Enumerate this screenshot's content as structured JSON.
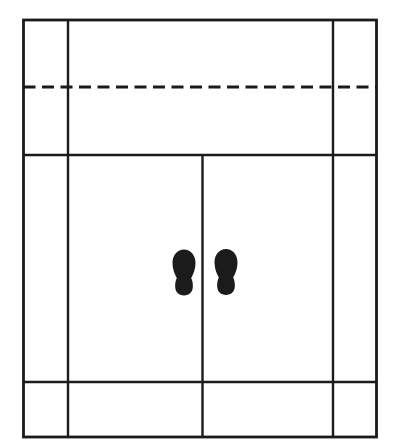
{
  "canvas": {
    "width": 395,
    "height": 447,
    "background_color": "#ffffff",
    "line_color": "#1b1b1b"
  },
  "diagram": {
    "footprint_path": "M 0 -23 C 6.5 -23 11.5 -17.5 11.5 -9.5 C 11.5 -3.5 9.5 1.5 7.2 5.5 C 8.6 8.5 9 11.5 8.8 14.8 C 8.5 19.8 5 23 0 23 C -5 23 -8.5 19.8 -8.8 14.8 C -9 11.5 -8.6 8.5 -7.2 5.5 C -9.5 1.5 -11.5 -3.5 -11.5 -9.5 C -11.5 -17.5 -6.5 -23 0 -23 Z",
    "elements": [
      {
        "name": "outer-wall-rect",
        "type": "rect",
        "x": 23.5,
        "y": 20,
        "width": 353,
        "height": 417,
        "stroke_width": 2.8
      },
      {
        "name": "left-vertical-line",
        "type": "line",
        "x1": 68,
        "y1": 20,
        "x2": 68,
        "y2": 437,
        "stroke_width": 2.4
      },
      {
        "name": "right-vertical-line",
        "type": "line",
        "x1": 333,
        "y1": 20,
        "x2": 333,
        "y2": 437,
        "stroke_width": 2.4
      },
      {
        "name": "dashed-horizontal-line",
        "type": "line",
        "x1": 23.5,
        "y1": 87,
        "x2": 376.5,
        "y2": 87,
        "stroke_width": 3.2,
        "dash": "12 6.5"
      },
      {
        "name": "upper-horizontal-line",
        "type": "line",
        "x1": 23.5,
        "y1": 155,
        "x2": 376.5,
        "y2": 155,
        "stroke_width": 2.6
      },
      {
        "name": "lower-horizontal-line",
        "type": "line",
        "x1": 23.5,
        "y1": 382,
        "x2": 376.5,
        "y2": 382,
        "stroke_width": 2.4
      },
      {
        "name": "center-vertical-line",
        "type": "line",
        "x1": 202.5,
        "y1": 155,
        "x2": 202.5,
        "y2": 437,
        "stroke_width": 2.4
      },
      {
        "name": "left-footprint-icon",
        "type": "footprint",
        "cx": 184,
        "cy": 272.5
      },
      {
        "name": "right-footprint-icon",
        "type": "footprint",
        "cx": 226,
        "cy": 272
      }
    ]
  }
}
